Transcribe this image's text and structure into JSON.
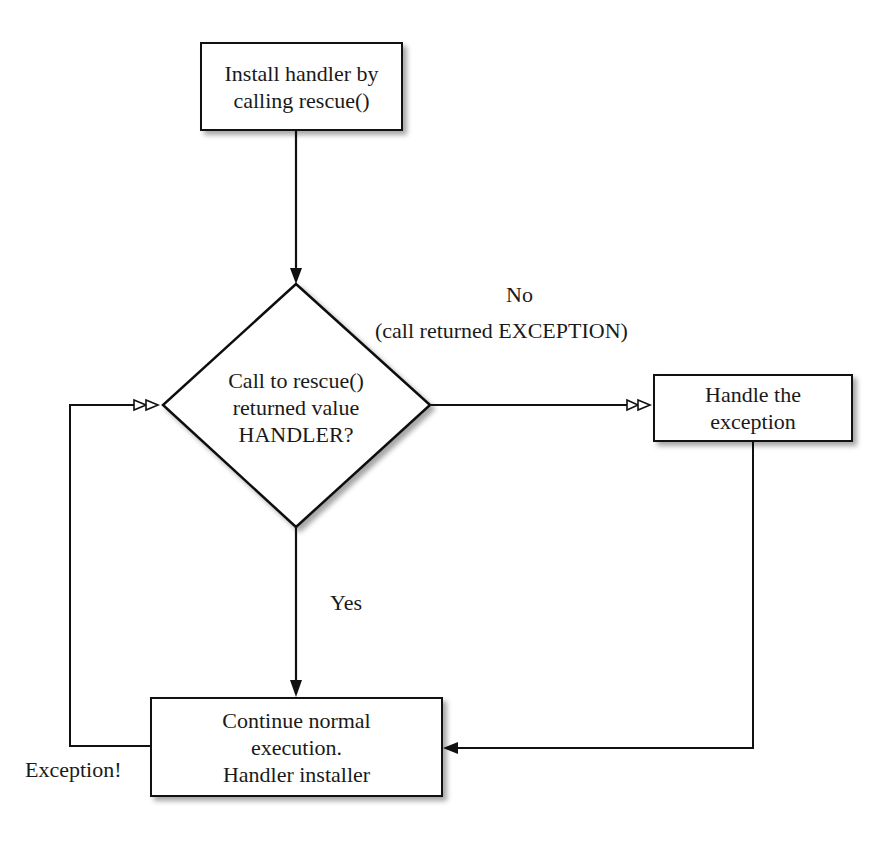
{
  "nodes": {
    "start": {
      "lines": [
        "Install handler by",
        "calling rescue()"
      ]
    },
    "decision": {
      "lines": [
        "Call to rescue()",
        "returned value",
        "HANDLER?"
      ]
    },
    "handle": {
      "lines": [
        "Handle the",
        "exception"
      ]
    },
    "continue": {
      "lines": [
        "Continue normal",
        "execution.",
        "Handler installer"
      ]
    }
  },
  "edges": {
    "no": {
      "label": "No",
      "sublabel": "(call returned EXCEPTION)"
    },
    "yes": {
      "label": "Yes"
    },
    "exception_loop": {
      "label": "Exception!"
    }
  },
  "colors": {
    "stroke": "#111111",
    "background": "#ffffff",
    "shadow": "#9a9a9a"
  }
}
